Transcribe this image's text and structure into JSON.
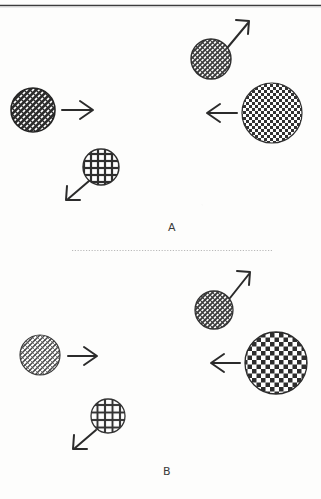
{
  "figure": {
    "title": "",
    "background_color": "#fdfdfc",
    "ink_color": "#2b2b2b",
    "top_rule": {
      "present": true,
      "y": 5,
      "color": "#3a3a3a"
    },
    "divider": {
      "style": "dotted",
      "y": 250,
      "x_start": 72,
      "x_end": 272,
      "color": "#b9b9b9"
    }
  },
  "panels": [
    {
      "id": "A",
      "label": "A",
      "label_x": 172,
      "label_y": 231,
      "circles": [
        {
          "name": "upper-right-circle",
          "texture": "diagonal-crosshatch-medium",
          "cx": 211,
          "cy": 59,
          "r": 20,
          "fill_density": "medium",
          "tone": "#4a4a4a"
        },
        {
          "name": "left-circle",
          "texture": "diagonal-crosshatch-dense",
          "cx": 33,
          "cy": 110,
          "r": 22,
          "fill_density": "dense",
          "tone": "#2e2e2e"
        },
        {
          "name": "right-large-circle",
          "texture": "checkerboard-diamond-fine",
          "cx": 272,
          "cy": 113,
          "r": 30,
          "fill_density": "medium",
          "tone": "#3d3d3d"
        },
        {
          "name": "lower-left-circle",
          "texture": "square-grid-coarse",
          "cx": 101,
          "cy": 167,
          "r": 18,
          "fill_density": "sparse",
          "tone": "#3a3a3a"
        }
      ],
      "arrows": [
        {
          "name": "arrow-up-right",
          "x1": 228,
          "y1": 46,
          "x2": 249,
          "y2": 22,
          "direction": "up-right"
        },
        {
          "name": "arrow-right",
          "x1": 62,
          "y1": 110,
          "x2": 92,
          "y2": 110,
          "direction": "right"
        },
        {
          "name": "arrow-left",
          "x1": 237,
          "y1": 113,
          "x2": 208,
          "y2": 113,
          "direction": "left"
        },
        {
          "name": "arrow-down-left",
          "x1": 88,
          "y1": 181,
          "x2": 67,
          "y2": 199,
          "direction": "down-left"
        }
      ]
    },
    {
      "id": "B",
      "label": "B",
      "label_x": 167,
      "label_y": 474,
      "circles": [
        {
          "name": "upper-right-circle",
          "texture": "diagonal-crosshatch-medium",
          "cx": 214,
          "cy": 310,
          "r": 19,
          "fill_density": "medium",
          "tone": "#4a4a4a"
        },
        {
          "name": "left-circle",
          "texture": "diagonal-crosshatch-sparse",
          "cx": 40,
          "cy": 355,
          "r": 20,
          "fill_density": "sparse",
          "tone": "#4f4f4f"
        },
        {
          "name": "right-large-circle",
          "texture": "checkerboard-diamond-coarse",
          "cx": 276,
          "cy": 363,
          "r": 31,
          "fill_density": "medium",
          "tone": "#333333"
        },
        {
          "name": "lower-left-circle",
          "texture": "square-grid-coarse",
          "cx": 108,
          "cy": 416,
          "r": 17,
          "fill_density": "sparse",
          "tone": "#3a3a3a"
        }
      ],
      "arrows": [
        {
          "name": "arrow-up-right",
          "x1": 230,
          "y1": 297,
          "x2": 250,
          "y2": 273,
          "direction": "up-right"
        },
        {
          "name": "arrow-right",
          "x1": 68,
          "y1": 356,
          "x2": 96,
          "y2": 356,
          "direction": "right"
        },
        {
          "name": "arrow-left",
          "x1": 240,
          "y1": 363,
          "x2": 212,
          "y2": 363,
          "direction": "left"
        },
        {
          "name": "arrow-down-left",
          "x1": 95,
          "y1": 430,
          "x2": 74,
          "y2": 448,
          "direction": "down-left"
        }
      ]
    }
  ]
}
